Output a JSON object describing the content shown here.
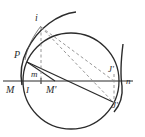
{
  "figure": {
    "type": "geometry-diagram",
    "title": "",
    "background_color": "#ffffff",
    "stroke_color": "#2b2b2b",
    "dashed_color": "#8a8a8a",
    "width": 145,
    "height": 137,
    "labels": [
      {
        "key": "i",
        "text": "i",
        "x": 37,
        "y": 19
      },
      {
        "key": "P",
        "text": "P",
        "x": 17,
        "y": 57
      },
      {
        "key": "m",
        "text": "m",
        "x": 35,
        "y": 75
      },
      {
        "key": "M",
        "text": "M",
        "x": 10,
        "y": 90
      },
      {
        "key": "I",
        "text": "I",
        "x": 29,
        "y": 91
      },
      {
        "key": "M_prime",
        "text": "M'",
        "x": 51,
        "y": 90
      },
      {
        "key": "J_prime_upper",
        "text": "J'",
        "x": 111,
        "y": 70
      },
      {
        "key": "n",
        "text": "n",
        "x": 129,
        "y": 82
      },
      {
        "key": "J_prime_lower",
        "text": "J'",
        "x": 115,
        "y": 106
      }
    ],
    "elements": [
      {
        "name": "horizontal-axis-line-MN",
        "kind": "line",
        "style": "solid"
      },
      {
        "name": "main-circle",
        "kind": "circle",
        "style": "solid"
      },
      {
        "name": "outer-arc-upper",
        "kind": "arc",
        "style": "solid"
      },
      {
        "name": "outer-arc-right",
        "kind": "arc",
        "style": "solid"
      },
      {
        "name": "chord-P-to-Jprime",
        "kind": "line",
        "style": "solid"
      },
      {
        "name": "segment-P-to-Mprime",
        "kind": "line",
        "style": "solid"
      },
      {
        "name": "dashed-vertical-i-to-I",
        "kind": "line",
        "style": "dashed"
      },
      {
        "name": "dashed-i-to-Jprime-upper",
        "kind": "line",
        "style": "dashed"
      },
      {
        "name": "dashed-i-to-Jprime-lower",
        "kind": "line",
        "style": "dashed"
      },
      {
        "name": "dashed-vertical-Jprime",
        "kind": "line",
        "style": "dashed"
      }
    ]
  }
}
